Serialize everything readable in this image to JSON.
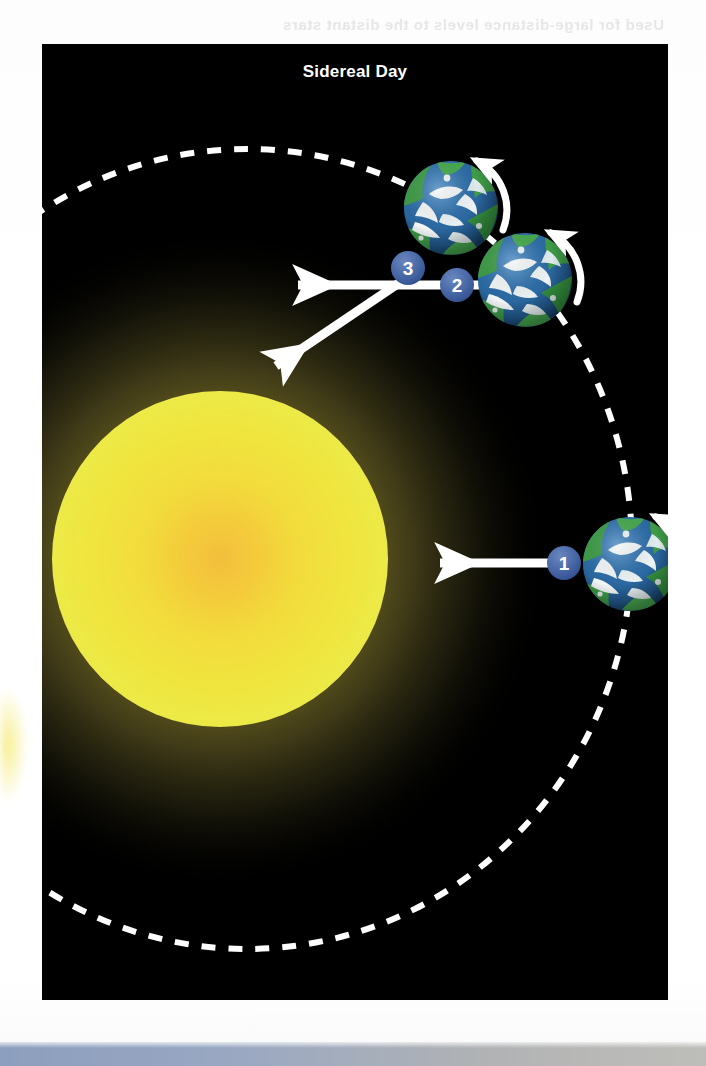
{
  "figure": {
    "title": "Sidereal Day",
    "background_color": "#000000",
    "panel": {
      "x": 42,
      "y": 44,
      "width": 626,
      "height": 956
    }
  },
  "sun": {
    "label": "sun",
    "center_x": 178,
    "center_y": 515,
    "radius": 168,
    "core_color": "#f4c13a",
    "body_color": "#f2e23c",
    "rim_color": "#ece43f",
    "glow_color": "#5d5618"
  },
  "orbit": {
    "label": "earth-orbit-path",
    "style": "dashed",
    "color": "#ffffff",
    "dash": "14 13",
    "stroke_width": 6,
    "center_x": 205,
    "center_y": 505,
    "radius_x": 385,
    "radius_y": 400
  },
  "earths": [
    {
      "id": "earth-1",
      "badge": "1",
      "center_x": 588,
      "center_y": 520,
      "radius": 48,
      "rotation": "counterclockwise"
    },
    {
      "id": "earth-2",
      "badge": "2",
      "center_x": 483,
      "center_y": 236,
      "radius": 47,
      "rotation": "counterclockwise"
    },
    {
      "id": "earth-3",
      "badge": "3",
      "center_x": 409,
      "center_y": 164,
      "radius": 47,
      "rotation": "counterclockwise"
    }
  ],
  "badges": [
    {
      "id": "badge-1",
      "text": "1",
      "x": 522,
      "y": 519,
      "radius": 17
    },
    {
      "id": "badge-2",
      "text": "2",
      "x": 415,
      "y": 241,
      "radius": 17
    },
    {
      "id": "badge-3",
      "text": "3",
      "x": 366,
      "y": 224,
      "radius": 17
    }
  ],
  "sightlines": [
    {
      "id": "sightline-earth1-to-sun",
      "from_x": 525,
      "from_y": 519,
      "to_x": 395,
      "to_y": 519,
      "color": "#ffffff",
      "description": "arrow from Earth 1 toward the Sun"
    },
    {
      "id": "sightline-distant-star",
      "from_x": 418,
      "from_y": 241,
      "to_x": 252,
      "to_y": 241,
      "color": "#ffffff",
      "description": "arrow toward distant star"
    },
    {
      "id": "sightline-earth3-to-sun",
      "from_x": 366,
      "from_y": 231,
      "to_x": 230,
      "to_y": 325,
      "color": "#ffffff",
      "description": "arrow from Earth 3 toward the Sun"
    }
  ],
  "colors": {
    "panel_black": "#000000",
    "title_white": "#ffffff",
    "badge_blue": "#4a6aa8",
    "badge_blue_dark": "#32508f",
    "ocean_blue": "#2f6ea8",
    "ocean_blue_dark": "#1d4f84",
    "land_green": "#3e9b47",
    "land_green_dark": "#2f7a38",
    "ice_white": "#f2f6f7",
    "sun_yellow": "#f2e23c",
    "sun_core": "#f4c13a",
    "glow_olive": "#5d5618"
  },
  "bleed_text": "Used for large-distance levels to the distant stars",
  "bottom_strip": {
    "left_color": "#8d9fbe",
    "right_color": "#bdbdba"
  }
}
